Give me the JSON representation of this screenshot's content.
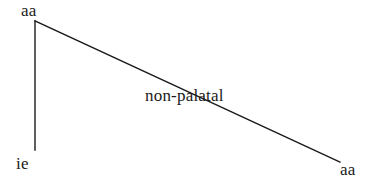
{
  "diagram": {
    "type": "branching-tree",
    "background_color": "#ffffff",
    "line_color": "#1a1a1a",
    "text_color": "#1a1a1a",
    "root": {
      "label": "aa",
      "x": 35,
      "y": 21
    },
    "branches": [
      {
        "name": "left-branch",
        "label": "",
        "leaf_label": "ie",
        "from_x": 35,
        "from_y": 21,
        "to_x": 35,
        "to_y": 150,
        "leaf_x": 16,
        "leaf_y": 155
      },
      {
        "name": "right-branch",
        "label": "non-palatal",
        "leaf_label": "aa",
        "from_x": 35,
        "from_y": 21,
        "to_x": 340,
        "to_y": 162,
        "leaf_x": 340,
        "leaf_y": 161,
        "label_x": 145,
        "label_y": 87
      }
    ]
  }
}
